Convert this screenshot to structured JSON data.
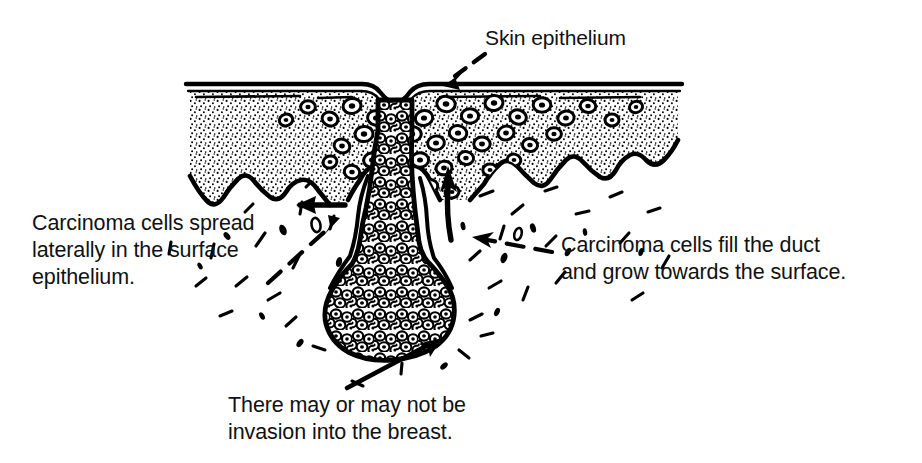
{
  "figure": {
    "background_color": "#ffffff",
    "ink_color": "#000000",
    "captions": {
      "skin_epithelium": "Skin epithelium",
      "lateral_spread": "Carcinoma cells spread\nlaterally in the surface\nepithelium.",
      "duct_fill": "Carcinoma cells fill the duct\nand grow towards the surface.",
      "invasion": "There may or may not be\ninvasion into the breast."
    },
    "cropped_header_text": "",
    "annotations": [
      {
        "name": "skin-epithelium-leader",
        "style": "dashed",
        "head": "down-left",
        "points_to": "skin surface at duct opening"
      },
      {
        "name": "lateral-spread-leader",
        "style": "dashed",
        "head": "up-right",
        "points_to": "epidermis left of duct"
      },
      {
        "name": "lateral-spread-direction-arrow",
        "style": "solid",
        "head": "left",
        "points_to": "lateral epidermal spread direction"
      },
      {
        "name": "duct-fill-leader",
        "style": "dashed",
        "head": "left",
        "points_to": "duct wall right side"
      },
      {
        "name": "duct-growth-direction-arrow",
        "style": "solid",
        "head": "up",
        "points_to": "growth towards the surface"
      },
      {
        "name": "invasion-leader",
        "style": "solid",
        "head": "up-right",
        "points_to": "tumour base in breast stroma"
      }
    ],
    "structures": [
      {
        "name": "skin-surface-line",
        "label": "Skin surface (stratum corneum)"
      },
      {
        "name": "epidermis-band",
        "label": "Stippled epidermis with rete ridges"
      },
      {
        "name": "carcinoma-cells-epidermis",
        "label": "Paget carcinoma cells in epidermis"
      },
      {
        "name": "lactiferous-duct",
        "label": "Duct filled with carcinoma cells"
      },
      {
        "name": "tumour-base",
        "label": "Bulbous tumour mass in breast"
      },
      {
        "name": "breast-stroma",
        "label": "Breast stroma with scattered fibres"
      }
    ]
  }
}
